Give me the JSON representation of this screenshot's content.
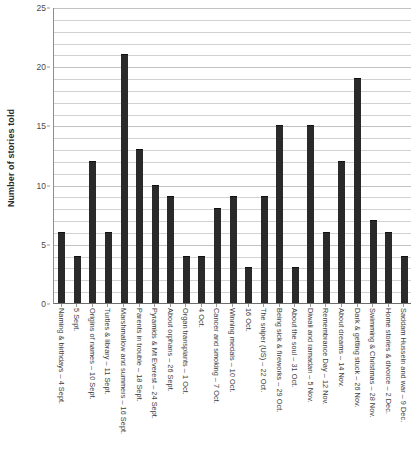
{
  "chart_data": {
    "type": "bar",
    "title": "",
    "xlabel": "",
    "ylabel": "Number of stories told",
    "ylim": [
      0,
      25
    ],
    "ytick_step": 5,
    "minor_gridline_step": 1,
    "grid": true,
    "legend": "none",
    "bar_color": "#2a2a2a",
    "categories": [
      "Naming & birthdays – 4 Sept.",
      "5 Sept.",
      "Origins of names – 10 Sept.",
      "Turtles & library – 11 Sept.",
      "Marshmallow and summers – 16 Sept.",
      "Parents in trouble – 18 Sept.",
      "Pyramids & Mt Everest – 24 Sept.",
      "About orphans – 26 Sept.",
      "Organ transplants – 1 Oct.",
      "4 Oct.",
      "Cancer and smoking – 7 Oct.",
      "Winning medals – 10 Oct.",
      "16 Oct.",
      "The sniper (US) – 22 Oct.",
      "Being sick & fireworks – 29 Oct.",
      "About the soul – 31 Oct.",
      "Diwali and ramadan – 5 Nov.",
      "Remembrance Day – 12 Nov.",
      "About dreams – 14 Nov.",
      "Dark & getting stuck – 26 Nov.",
      "Swimming & Christmas – 28 Nov.",
      "Home stories & divorce – 2 Dec.",
      "Saddam Hussein and war – 9 Dec."
    ],
    "values": [
      6,
      4,
      12,
      6,
      21,
      13,
      10,
      9,
      4,
      4,
      8,
      9,
      3,
      9,
      15,
      3,
      15,
      6,
      12,
      19,
      7,
      6,
      4
    ],
    "ytick_labels": [
      "0",
      "5",
      "10",
      "15",
      "20",
      "25"
    ],
    "ytick_values": [
      0,
      5,
      10,
      15,
      20,
      25
    ]
  }
}
